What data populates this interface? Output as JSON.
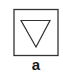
{
  "figure": {
    "label": "a",
    "shapes": {
      "box": "square-outline",
      "symbol": "downward-triangle-outline"
    },
    "colors": {
      "stroke": "#333333",
      "background": "#ffffff",
      "label": "#1a1a1a"
    }
  }
}
